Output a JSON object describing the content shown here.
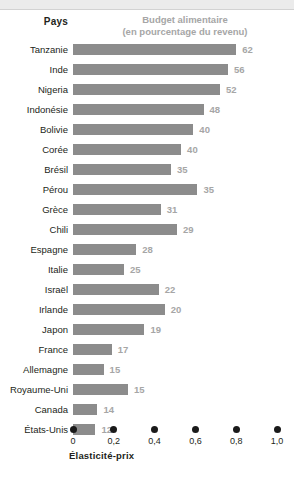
{
  "header": {
    "col_country": "Pays",
    "col_budget_line1": "Budget alimentaire",
    "col_budget_line2": "(en pourcentage du revenu)"
  },
  "axis": {
    "title": "Élasticité-prix",
    "ticks": [
      "0",
      "0,2",
      "0,4",
      "0,6",
      "0,8",
      "1,0"
    ]
  },
  "colors": {
    "bar": "#8c8c8c",
    "value_text": "#a6a6a6",
    "label_text": "#231f20",
    "top_band": "#ebebeb",
    "dot": "#1a1a1a"
  },
  "chart_data": {
    "type": "bar",
    "title": "Budget alimentaire (en pourcentage du revenu)",
    "xlabel": "Élasticité-prix",
    "ylabel": "Pays",
    "orientation": "horizontal",
    "grid": false,
    "legend": "none",
    "xlim": [
      0,
      1.0
    ],
    "xticks": [
      0,
      0.2,
      0.4,
      0.6,
      0.8,
      1.0
    ],
    "xtick_labels": [
      "0",
      "0,2",
      "0,4",
      "0,6",
      "0,8",
      "1,0"
    ],
    "note": "Bar length encodes Élasticité-prix (0 to 1,0); the number at the end of each bar is the Budget alimentaire as a percentage of income.",
    "categories": [
      "Tanzanie",
      "Inde",
      "Nigeria",
      "Indonésie",
      "Bolivie",
      "Corée",
      "Brésil",
      "Pérou",
      "Grèce",
      "Chili",
      "Espagne",
      "Italie",
      "Israël",
      "Irlande",
      "Japon",
      "France",
      "Allemagne",
      "Royaume-Uni",
      "Canada",
      "États-Unis"
    ],
    "series": [
      {
        "name": "Élasticité-prix",
        "values": [
          0.8,
          0.76,
          0.72,
          0.64,
          0.59,
          0.53,
          0.48,
          0.61,
          0.43,
          0.51,
          0.31,
          0.25,
          0.42,
          0.45,
          0.35,
          0.19,
          0.15,
          0.27,
          0.12,
          0.11
        ]
      },
      {
        "name": "Budget alimentaire (% du revenu)",
        "values": [
          62,
          56,
          52,
          48,
          40,
          40,
          35,
          35,
          31,
          29,
          28,
          25,
          22,
          20,
          19,
          17,
          15,
          15,
          14,
          12
        ]
      }
    ],
    "rows": [
      {
        "country": "Tanzanie",
        "elasticity": 0.8,
        "budget": 62,
        "budget_label": "62"
      },
      {
        "country": "Inde",
        "elasticity": 0.76,
        "budget": 56,
        "budget_label": "56"
      },
      {
        "country": "Nigeria",
        "elasticity": 0.72,
        "budget": 52,
        "budget_label": "52"
      },
      {
        "country": "Indonésie",
        "elasticity": 0.64,
        "budget": 48,
        "budget_label": "48"
      },
      {
        "country": "Bolivie",
        "elasticity": 0.59,
        "budget": 40,
        "budget_label": "40"
      },
      {
        "country": "Corée",
        "elasticity": 0.53,
        "budget": 40,
        "budget_label": "40"
      },
      {
        "country": "Brésil",
        "elasticity": 0.48,
        "budget": 35,
        "budget_label": "35"
      },
      {
        "country": "Pérou",
        "elasticity": 0.61,
        "budget": 35,
        "budget_label": "35"
      },
      {
        "country": "Grèce",
        "elasticity": 0.43,
        "budget": 31,
        "budget_label": "31"
      },
      {
        "country": "Chili",
        "elasticity": 0.51,
        "budget": 29,
        "budget_label": "29"
      },
      {
        "country": "Espagne",
        "elasticity": 0.31,
        "budget": 28,
        "budget_label": "28"
      },
      {
        "country": "Italie",
        "elasticity": 0.25,
        "budget": 25,
        "budget_label": "25"
      },
      {
        "country": "Israël",
        "elasticity": 0.42,
        "budget": 22,
        "budget_label": "22"
      },
      {
        "country": "Irlande",
        "elasticity": 0.45,
        "budget": 20,
        "budget_label": "20"
      },
      {
        "country": "Japon",
        "elasticity": 0.35,
        "budget": 19,
        "budget_label": "19"
      },
      {
        "country": "France",
        "elasticity": 0.19,
        "budget": 17,
        "budget_label": "17"
      },
      {
        "country": "Allemagne",
        "elasticity": 0.15,
        "budget": 15,
        "budget_label": "15"
      },
      {
        "country": "Royaume-Uni",
        "elasticity": 0.27,
        "budget": 15,
        "budget_label": "15"
      },
      {
        "country": "Canada",
        "elasticity": 0.12,
        "budget": 14,
        "budget_label": "14"
      },
      {
        "country": "États-Unis",
        "elasticity": 0.11,
        "budget": 12,
        "budget_label": "12"
      }
    ]
  }
}
